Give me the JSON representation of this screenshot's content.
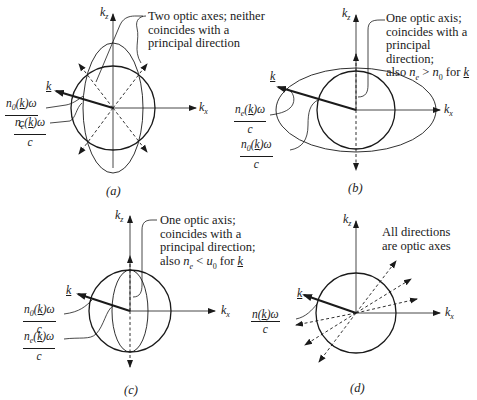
{
  "figure": {
    "panels": [
      {
        "id": "a",
        "caption": "(a)",
        "axis_labels": {
          "vertical": "k",
          "vertical_sub": "z",
          "horizontal": "k",
          "horizontal_sub": "x",
          "vector": "k"
        },
        "annotation": [
          "Two optic axes; neither",
          "coincides with a",
          "principal direction"
        ],
        "fractions": [
          {
            "num": "n0(k)ω",
            "den": "c",
            "target": "circle"
          },
          {
            "num": "ne(k)ω",
            "den": "c",
            "target": "ellipse"
          }
        ],
        "shape": "tall ellipse intersecting circle; two dashed optic axes"
      },
      {
        "id": "b",
        "caption": "(b)",
        "axis_labels": {
          "vertical": "k",
          "vertical_sub": "z",
          "horizontal": "k",
          "horizontal_sub": "x",
          "vector": "k"
        },
        "annotation": [
          "One optic axis;",
          "coincides with a",
          "principal direction;",
          "also ne > n0 for k"
        ],
        "fractions": [
          {
            "num": "ne(k)ω",
            "den": "c",
            "target": "ellipse"
          },
          {
            "num": "n0(k)ω",
            "den": "c",
            "target": "circle"
          }
        ],
        "shape": "wide ellipse enclosing circle; dashed vertical optic axis"
      },
      {
        "id": "c",
        "caption": "(c)",
        "axis_labels": {
          "vertical": "k",
          "vertical_sub": "z",
          "horizontal": "k",
          "horizontal_sub": "x",
          "vector": "k"
        },
        "annotation": [
          "One optic axis;",
          "coincides with a",
          "principal direction;",
          "also ne < u0 for k"
        ],
        "fractions": [
          {
            "num": "n0(k)ω",
            "den": "c",
            "target": "circle"
          },
          {
            "num": "ne(k)ω",
            "den": "c",
            "target": "ellipse"
          }
        ],
        "shape": "narrow ellipse inside circle; dashed vertical optic axis"
      },
      {
        "id": "d",
        "caption": "(d)",
        "axis_labels": {
          "vertical": "k",
          "vertical_sub": "z",
          "horizontal": "k",
          "horizontal_sub": "x",
          "vector": "k"
        },
        "annotation": [
          "All directions",
          "are optic axes"
        ],
        "fractions": [
          {
            "num": "n(k)ω",
            "den": "c",
            "target": "circle"
          }
        ],
        "shape": "circle only; many dashed optic axes"
      }
    ]
  }
}
